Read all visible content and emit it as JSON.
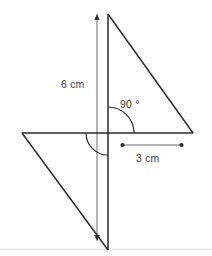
{
  "figure": {
    "background_color": "#ffffff",
    "stroke_color": "#2b2b2b",
    "thin_stroke_color": "#555555",
    "baseline_color": "#e4e4e4",
    "text_color": "#3b3b3b",
    "labels": {
      "vertical_measure": "6 cm",
      "angle": "90 °",
      "horizontal_measure": "3 cm"
    },
    "shapes": {
      "upper_triangle": {
        "name": "upper-right-triangle",
        "points": "108,14 108,133 193,133",
        "vertices": [
          {
            "label": "apex-top",
            "x": 108,
            "y": 14
          },
          {
            "label": "right-angle-corner",
            "x": 108,
            "y": 133
          },
          {
            "label": "right-vertex",
            "x": 193,
            "y": 133
          }
        ]
      },
      "lower_triangle": {
        "name": "lower-left-triangle",
        "points": "22,133 108,133 108,250",
        "vertices": [
          {
            "label": "left-vertex",
            "x": 22,
            "y": 133
          },
          {
            "label": "right-angle-corner",
            "x": 108,
            "y": 133
          },
          {
            "label": "bottom-vertex",
            "x": 108,
            "y": 250
          }
        ]
      }
    },
    "lines": {
      "vertical_triangle_edge": {
        "x1": 108,
        "y1": 14,
        "x2": 108,
        "y2": 250
      },
      "horizontal_axis": {
        "x1": 22,
        "y1": 133,
        "x2": 193,
        "y2": 133
      },
      "vertical_measure_line": {
        "x1": 97,
        "y1": 15,
        "x2": 97,
        "y2": 240
      },
      "horizontal_measure_line": {
        "x1": 122,
        "y1": 145,
        "x2": 182,
        "y2": 145
      },
      "baseline": {
        "x1": 0,
        "y1": 249,
        "x2": 212,
        "y2": 249
      }
    },
    "arcs": {
      "right_angle_arc": {
        "name": "ninety-degree-arc",
        "center_x": 108,
        "center_y": 133,
        "radius": 26,
        "start_deg": -90,
        "end_deg": 0,
        "path": "M 108 107 A 26 26 0 0 1 134 133"
      },
      "reflex_lower_arc": {
        "name": "lower-left-arc",
        "center_x": 108,
        "center_y": 133,
        "radius": 22,
        "start_deg": 180,
        "end_deg": 90,
        "path": "M 86 133 A 22 22 0 0 0 108 155"
      }
    },
    "markers": {
      "arrow_top": {
        "x": 97,
        "y": 15
      },
      "arrow_bottom": {
        "x": 97,
        "y": 240
      },
      "dot_left": {
        "x": 122,
        "y": 145
      },
      "dot_right": {
        "x": 182,
        "y": 145
      }
    }
  }
}
